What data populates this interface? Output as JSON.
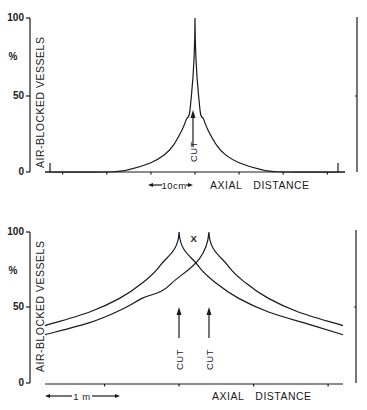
{
  "chart_data": [
    {
      "type": "line",
      "panel": "top",
      "title": "",
      "ylabel": "AIR-BLOCKED VESSELS",
      "yunit": "%",
      "xlabel": "AXIAL DISTANCE",
      "yticks": [
        "0",
        "50",
        "100"
      ],
      "ylim": [
        0,
        100
      ],
      "x_units": "cm",
      "xlim": [
        -34,
        34
      ],
      "scale_bar": {
        "label": "10cm",
        "length": 10
      },
      "grid": false,
      "legend": "none",
      "series": [
        {
          "name": "air-blocked vessels (single cut)",
          "x": [
            -34,
            -20,
            -15,
            -10,
            -7,
            -5,
            -3,
            -2,
            -1,
            0,
            1,
            2,
            3,
            5,
            7,
            10,
            15,
            20,
            34
          ],
          "y": [
            0,
            0,
            1.5,
            6,
            11,
            17,
            27,
            34,
            44,
            100,
            44,
            34,
            27,
            17,
            11,
            6,
            1.5,
            0,
            0
          ]
        }
      ],
      "annotations": [
        {
          "text": "CUT",
          "x": 0,
          "arrow": "up"
        }
      ]
    },
    {
      "type": "line",
      "panel": "bottom",
      "title": "",
      "ylabel": "AIR-BLOCKED VESSELS",
      "yunit": "%",
      "xlabel": "AXIAL DISTANCE",
      "yticks": [
        "0",
        "50",
        "100"
      ],
      "ylim": [
        0,
        100
      ],
      "x_units": "m",
      "xlim": [
        -1.8,
        2.2
      ],
      "scale_bar": {
        "label": "1 m",
        "length": 1
      },
      "grid": false,
      "legend": "none",
      "series": [
        {
          "name": "cut A",
          "x": [
            -1.8,
            -1.2,
            -0.8,
            -0.5,
            -0.25,
            0,
            0.25,
            0.5,
            0.8,
            1.2,
            1.8,
            2.2
          ],
          "y": [
            38,
            47,
            56,
            66,
            78,
            100,
            78,
            66,
            56,
            47,
            38,
            32
          ]
        },
        {
          "name": "cut B",
          "x": [
            -1.8,
            -1.2,
            -0.8,
            -0.5,
            -0.1,
            0.4,
            0.65,
            0.9,
            1.2,
            1.6,
            2.2
          ],
          "y": [
            32,
            40,
            48,
            56,
            66,
            100,
            78,
            66,
            56,
            47,
            38
          ]
        }
      ],
      "annotations": [
        {
          "text": "CUT",
          "x": 0,
          "arrow": "up"
        },
        {
          "text": "CUT",
          "x": 0.4,
          "arrow": "up"
        },
        {
          "text": "X",
          "x": 0.2,
          "y": 98
        }
      ]
    }
  ]
}
